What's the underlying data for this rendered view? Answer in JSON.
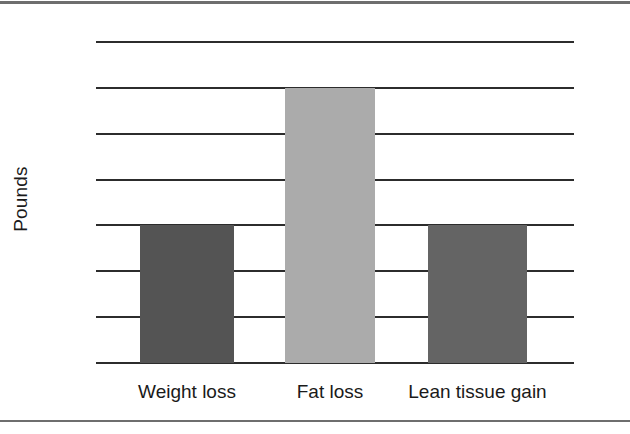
{
  "figure": {
    "y_axis_title": "Pounds"
  },
  "chart_data": {
    "type": "bar",
    "title": "",
    "xlabel": "",
    "ylabel": "Pounds",
    "categories": [
      "Weight loss",
      "Fat loss",
      "Lean tissue gain"
    ],
    "values": [
      3,
      6,
      3
    ],
    "series": [
      {
        "name": "Pounds",
        "values": [
          3,
          6,
          3
        ]
      }
    ],
    "bar_colors": [
      "#545454",
      "#ababab",
      "#646464"
    ],
    "ylim": [
      0,
      7
    ],
    "ytick_labels": [
      "0",
      "1",
      "2",
      "3",
      "4",
      "5",
      "6",
      "7"
    ],
    "ytick_values": [
      0,
      1,
      2,
      3,
      4,
      5,
      6,
      7
    ],
    "grid": true,
    "grid_axis": "y",
    "grid_color": "#2c2c2c",
    "legend": false,
    "legend_position": "none"
  },
  "style": {
    "rule_color": "#6e6e6e",
    "text_color": "#1a1a1a",
    "background": "#ffffff"
  }
}
